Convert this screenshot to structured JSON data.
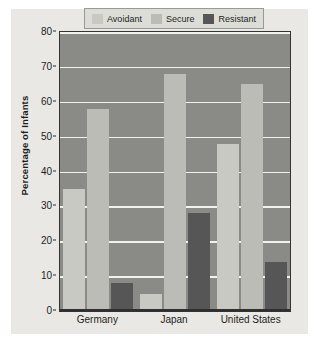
{
  "chart_data": {
    "type": "bar",
    "title": "",
    "xlabel": "",
    "ylabel": "Percentage of Infants",
    "categories": [
      "Germany",
      "Japan",
      "United States"
    ],
    "series": [
      {
        "name": "Avoidant",
        "values": [
          35,
          5,
          48
        ]
      },
      {
        "name": "Secure",
        "values": [
          58,
          68,
          65
        ]
      },
      {
        "name": "Resistant",
        "values": [
          8,
          28,
          14
        ]
      }
    ],
    "ylim": [
      0,
      80
    ],
    "ytick_values": [
      0,
      10,
      20,
      30,
      40,
      50,
      60,
      70,
      80
    ],
    "ytick_labels": [
      "0",
      "10",
      "20",
      "30",
      "40",
      "50",
      "60",
      "70",
      "80"
    ],
    "grid": true,
    "legend_position": "top-left-inside",
    "colors": {
      "avoidant": "#c9c9c4",
      "secure": "#bcbcb6",
      "resistant": "#565656",
      "plot_background": "#8a8a86",
      "gridline": "#f2f1ec",
      "page_background": "#e9e8e4",
      "legend_background": "#ddddd7",
      "text": "#1d1d1d"
    }
  },
  "legend": {
    "items": [
      {
        "label": "Avoidant"
      },
      {
        "label": "Secure"
      },
      {
        "label": "Resistant"
      }
    ]
  }
}
